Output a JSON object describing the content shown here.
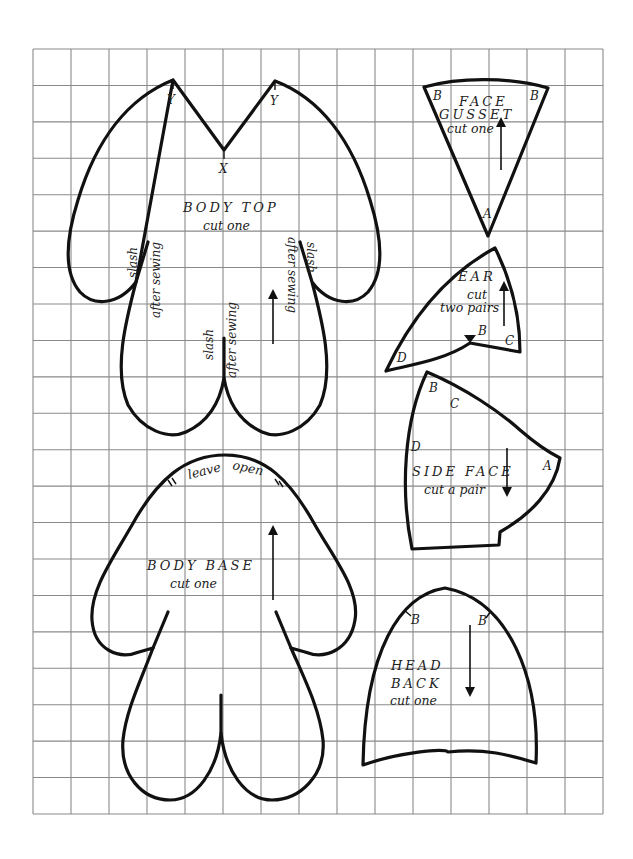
{
  "sheet": {
    "grid": {
      "columns": 15,
      "rows": 21,
      "line_color": "#8a8a8a"
    },
    "outline_color": "#111111"
  },
  "pieces": {
    "body_top": {
      "title": "BODY TOP",
      "instruction": "cut one",
      "marks": {
        "y_left": "Y",
        "y_right": "Y",
        "x": "X"
      },
      "slash_notes": [
        {
          "line1": "slash",
          "line2": "after sewing"
        },
        {
          "line1": "slash",
          "line2": "after sewing"
        },
        {
          "line1": "slash",
          "line2": "after sewing"
        }
      ]
    },
    "face_gusset": {
      "title_line1": "FACE",
      "title_line2": "GUSSET",
      "instruction": "cut one",
      "marks": {
        "b_left": "B",
        "b_right": "B",
        "a": "A"
      }
    },
    "ear": {
      "title": "EAR",
      "instruction_line1": "cut",
      "instruction_line2": "two pairs",
      "marks": {
        "b": "B",
        "c": "C",
        "d": "D"
      }
    },
    "side_face": {
      "title": "SIDE FACE",
      "instruction": "cut a pair",
      "marks": {
        "b": "B",
        "c": "C",
        "d": "D",
        "a": "A"
      }
    },
    "body_base": {
      "title": "BODY BASE",
      "instruction": "cut one",
      "opening_note_1": "leave",
      "opening_note_2": "open",
      "marks": {
        "notch_left": "=",
        "notch_right": "="
      }
    },
    "head_back": {
      "title_line1": "HEAD",
      "title_line2": "BACK",
      "instruction": "cut one",
      "marks": {
        "b_left": "B",
        "b_right": "B"
      }
    }
  }
}
